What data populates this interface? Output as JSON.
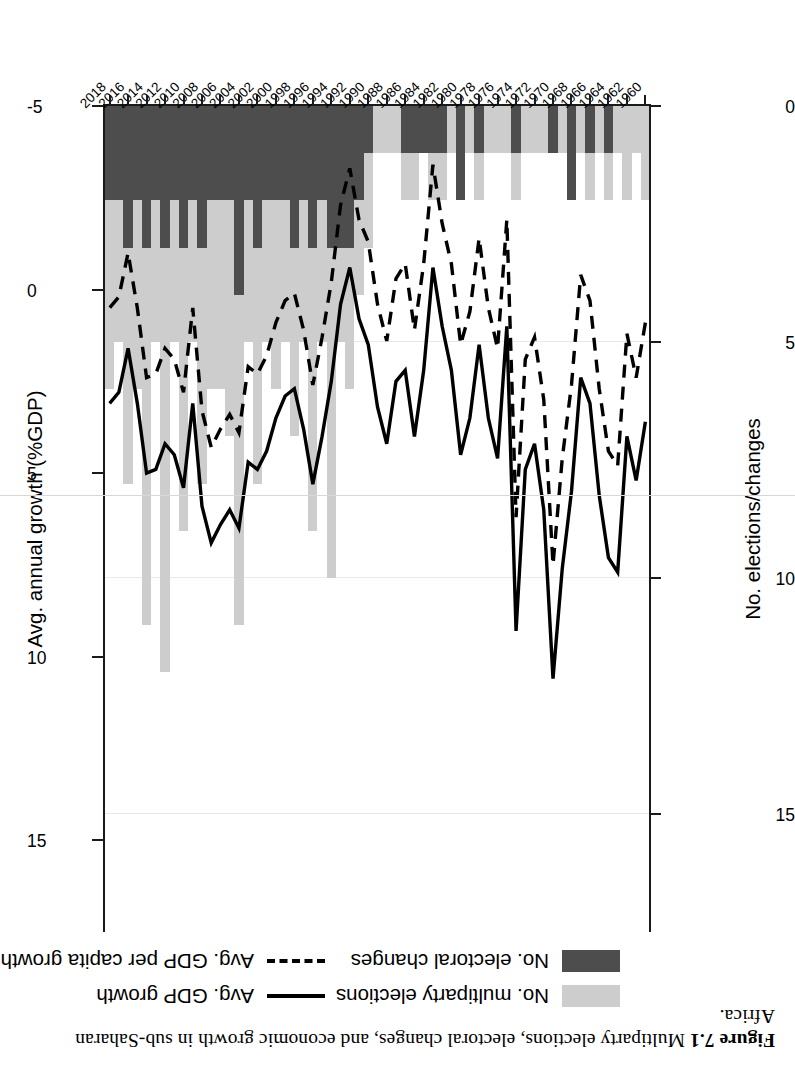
{
  "figure": {
    "number": "Figure 7.1",
    "caption": "Multiparty elections, electoral changes, and economic growth in sub-Saharan Africa."
  },
  "legend": {
    "items": [
      {
        "label": "No. multiparty elections",
        "marker": "filled-square",
        "color": "#cdcdcd"
      },
      {
        "label": "No. electoral changes",
        "marker": "filled-square",
        "color": "#4d4d4d"
      },
      {
        "label": "Avg. GDP growth",
        "marker": "solid-line",
        "color": "#000000"
      },
      {
        "label": "Avg. GDP per capita growth",
        "marker": "dashed-line",
        "color": "#000000"
      }
    ]
  },
  "axes": {
    "left": {
      "title": "No. elections/changes",
      "ticks": [
        "0",
        "5",
        "10",
        "15"
      ],
      "min": 0,
      "max": 17.5
    },
    "right": {
      "title": "Avg. annual growth (%GDP)",
      "ticks": [
        "-5",
        "0",
        "5",
        "10",
        "15"
      ],
      "min": -5,
      "max": 17.5
    },
    "bottom": {
      "title": "",
      "ticks": [
        "1960",
        "1962",
        "1964",
        "1966",
        "1968",
        "1970",
        "1972",
        "1974",
        "1976",
        "1978",
        "1980",
        "1982",
        "1984",
        "1986",
        "1988",
        "1990",
        "1992",
        "1994",
        "1996",
        "1998",
        "2000",
        "2002",
        "2004",
        "2006",
        "2008",
        "2010",
        "2012",
        "2014",
        "2016",
        "2018"
      ]
    }
  },
  "chart_data": {
    "type": "bar",
    "title": "Multiparty elections, electoral changes, and economic growth in sub-Saharan Africa",
    "xlabel": "",
    "ylabel": "No. elections/changes",
    "y2label": "Avg. annual growth (%GDP)",
    "ylim": [
      0,
      17.5
    ],
    "y2lim": [
      -5,
      17.5
    ],
    "grid": true,
    "legend_position": "bottom",
    "x": [
      1960,
      1961,
      1962,
      1963,
      1964,
      1965,
      1966,
      1967,
      1968,
      1969,
      1970,
      1971,
      1972,
      1973,
      1974,
      1975,
      1976,
      1977,
      1978,
      1979,
      1980,
      1981,
      1982,
      1983,
      1984,
      1985,
      1986,
      1987,
      1988,
      1989,
      1990,
      1991,
      1992,
      1993,
      1994,
      1995,
      1996,
      1997,
      1998,
      1999,
      2000,
      2001,
      2002,
      2003,
      2004,
      2005,
      2006,
      2007,
      2008,
      2009,
      2010,
      2011,
      2012,
      2013,
      2014,
      2015,
      2016,
      2017,
      2018
    ],
    "series": [
      {
        "name": "No. multiparty elections",
        "type": "bar",
        "axis": "left",
        "color": "#cdcdcd",
        "values": [
          2,
          1,
          2,
          1,
          2,
          1,
          2,
          1,
          2,
          1,
          1,
          1,
          1,
          1,
          2,
          1,
          1,
          1,
          2,
          1,
          2,
          1,
          2,
          2,
          1,
          2,
          2,
          1,
          1,
          1,
          3,
          4,
          6,
          5,
          10,
          5,
          9,
          5,
          7,
          5,
          6,
          5,
          8,
          5,
          11,
          7,
          6,
          6,
          8,
          5,
          9,
          5,
          12,
          5,
          11,
          6,
          8,
          5,
          6
        ]
      },
      {
        "name": "No. electoral changes",
        "type": "bar",
        "axis": "left",
        "color": "#4d4d4d",
        "values": [
          0,
          0,
          0,
          0,
          1,
          0,
          1,
          0,
          2,
          0,
          1,
          0,
          0,
          0,
          1,
          0,
          0,
          0,
          1,
          0,
          2,
          0,
          1,
          1,
          1,
          1,
          1,
          0,
          0,
          0,
          1,
          2,
          3,
          3,
          3,
          2,
          3,
          2,
          3,
          2,
          2,
          2,
          3,
          2,
          4,
          2,
          2,
          2,
          3,
          2,
          3,
          2,
          3,
          2,
          3,
          2,
          3,
          2,
          2
        ]
      },
      {
        "name": "Avg. GDP growth",
        "type": "line",
        "axis": "right",
        "style": "solid",
        "color": "#000000",
        "values": [
          3.6,
          5.2,
          4.0,
          7.7,
          7.3,
          5.6,
          3.1,
          2.4,
          5.5,
          7.6,
          10.6,
          6.0,
          4.2,
          4.9,
          9.3,
          1.0,
          4.6,
          3.5,
          1.5,
          3.5,
          4.5,
          2.2,
          1.0,
          -0.6,
          2.2,
          4.0,
          2.2,
          2.5,
          4.2,
          3.2,
          1.5,
          0.8,
          -0.6,
          0.4,
          2.5,
          4.0,
          5.3,
          3.8,
          2.7,
          2.9,
          3.5,
          4.4,
          4.9,
          4.7,
          6.5,
          6.0,
          6.4,
          6.9,
          5.9,
          3.1,
          5.4,
          4.5,
          4.2,
          4.9,
          5.0,
          3.1,
          1.6,
          2.8,
          3.1
        ]
      },
      {
        "name": "Avg. GDP per capita growth",
        "type": "line",
        "axis": "right",
        "style": "dashed",
        "color": "#000000",
        "values": [
          0.9,
          2.4,
          1.2,
          4.8,
          4.4,
          2.7,
          0.3,
          -0.4,
          2.6,
          4.6,
          7.5,
          3.0,
          1.3,
          1.9,
          6.2,
          -1.9,
          1.6,
          0.5,
          -1.4,
          0.6,
          1.5,
          -0.7,
          -1.8,
          -3.4,
          -0.7,
          1.1,
          -0.7,
          -0.3,
          1.4,
          0.4,
          -1.3,
          -1.9,
          -3.3,
          -2.3,
          -0.2,
          1.3,
          2.6,
          1.1,
          0.1,
          0.3,
          0.9,
          1.8,
          2.3,
          2.1,
          3.9,
          3.4,
          3.8,
          4.3,
          3.3,
          0.5,
          2.8,
          1.9,
          1.6,
          2.3,
          2.4,
          0.5,
          -1.0,
          0.2,
          0.5
        ]
      }
    ]
  }
}
